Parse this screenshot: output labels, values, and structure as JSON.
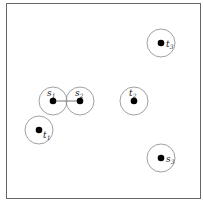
{
  "diagram": {
    "frame": {
      "x": 6.5,
      "y": 3.5,
      "w": 194,
      "h": 195,
      "stroke": "#666666"
    },
    "disk_radius": 14,
    "point_radius": 3.3,
    "circle_stroke": "#888888",
    "point_fill": "#000000",
    "nodes": [
      {
        "id": "s1",
        "base": "s",
        "sub": "1",
        "cx": 53,
        "cy": 101,
        "lx": 47,
        "ly": 96,
        "lpos": "above"
      },
      {
        "id": "s2",
        "base": "s",
        "sub": "2",
        "cx": 80,
        "cy": 101,
        "lx": 75,
        "ly": 96,
        "lpos": "above"
      },
      {
        "id": "t2",
        "base": "t",
        "sub": "2",
        "cx": 134,
        "cy": 101,
        "lx": 129,
        "ly": 96,
        "lpos": "above"
      },
      {
        "id": "t1",
        "base": "t",
        "sub": "1",
        "cx": 39,
        "cy": 130,
        "lx": 43,
        "ly": 138,
        "lpos": "right"
      },
      {
        "id": "t3",
        "base": "t",
        "sub": "3",
        "cx": 161,
        "cy": 43,
        "lx": 166,
        "ly": 47,
        "lpos": "right"
      },
      {
        "id": "s3",
        "base": "s",
        "sub": "3",
        "cx": 161,
        "cy": 158,
        "lx": 166,
        "ly": 162,
        "lpos": "right"
      }
    ],
    "edges": [
      {
        "from": "s1",
        "to": "s2"
      }
    ]
  }
}
